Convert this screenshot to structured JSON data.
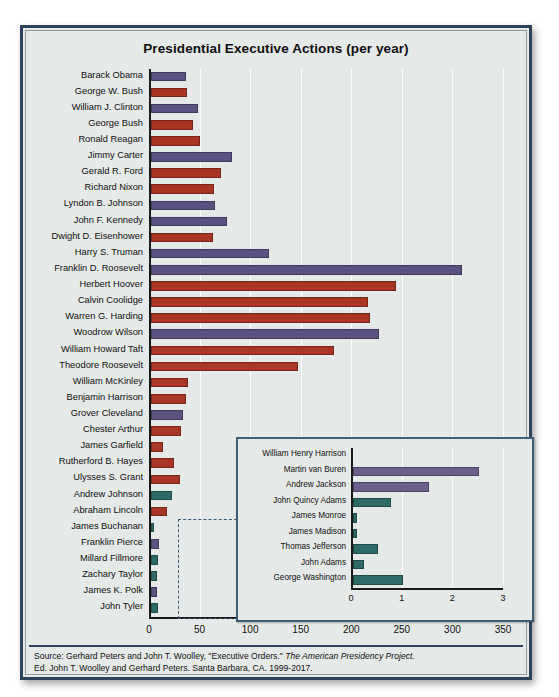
{
  "figure": {
    "title": "Presidential Executive Actions (per year)",
    "source_line1_pre": "Source: Gerhard Peters and John T. Woolley, \"Executive Orders.\" ",
    "source_line1_italic": "The American Presidency Project.",
    "source_line2": "Ed. John T. Woolley and Gerhard Peters. Santa Barbara, CA. 1999-2017."
  },
  "colors": {
    "democrat_purple": "#5c5282",
    "republican_red": "#a93524",
    "early_teal": "#2e6b66",
    "frame": "#2c4258",
    "panel_bg": "#e5e9e7",
    "gridline": "#fbfcfb",
    "axis": "#1a1a1a"
  },
  "chart_data": {
    "type": "bar",
    "title": "Presidential Executive Actions (per year)",
    "xlabel": "",
    "ylabel": "",
    "orientation": "horizontal",
    "xlim": [
      0,
      350
    ],
    "xticks": [
      0,
      50,
      100,
      150,
      200,
      250,
      300,
      350
    ],
    "grid": true,
    "legend": "none",
    "categories": [
      "Barack Obama",
      "George W. Bush",
      "William J. Clinton",
      "George Bush",
      "Ronald Reagan",
      "Jimmy Carter",
      "Gerald R. Ford",
      "Richard Nixon",
      "Lyndon B. Johnson",
      "John F. Kennedy",
      "Dwight D. Eisenhower",
      "Harry S. Truman",
      "Franklin D. Roosevelt",
      "Herbert Hoover",
      "Calvin Coolidge",
      "Warren G. Harding",
      "Woodrow Wilson",
      "William Howard Taft",
      "Theodore Roosevelt",
      "William McKinley",
      "Benjamin Harrison",
      "Grover Cleveland",
      "Chester Arthur",
      "James Garfield",
      "Rutherford B. Hayes",
      "Ulysses S. Grant",
      "Andrew Johnson",
      "Abraham Lincoln",
      "James Buchanan",
      "Franklin Pierce",
      "Millard Fillmore",
      "Zachary Taylor",
      "James K. Polk",
      "John Tyler"
    ],
    "values": [
      35,
      36,
      46,
      42,
      48,
      80,
      69,
      62,
      63,
      75,
      61,
      117,
      307,
      242,
      215,
      217,
      225,
      181,
      145,
      37,
      35,
      32,
      30,
      12,
      23,
      29,
      21,
      16,
      3,
      8,
      7,
      6,
      6,
      7
    ],
    "bar_colors": [
      "#5c5282",
      "#a93524",
      "#5c5282",
      "#a93524",
      "#a93524",
      "#5c5282",
      "#a93524",
      "#a93524",
      "#5c5282",
      "#5c5282",
      "#a93524",
      "#5c5282",
      "#5c5282",
      "#a93524",
      "#a93524",
      "#a93524",
      "#5c5282",
      "#a93524",
      "#a93524",
      "#a93524",
      "#a93524",
      "#5c5282",
      "#a93524",
      "#a93524",
      "#a93524",
      "#a93524",
      "#2e6b66",
      "#a93524",
      "#2e6b66",
      "#5c5282",
      "#2e6b66",
      "#2e6b66",
      "#5c5282",
      "#2e6b66"
    ]
  },
  "inset_chart_data": {
    "type": "bar",
    "orientation": "horizontal",
    "xlim": [
      0,
      3
    ],
    "xticks": [
      0,
      1,
      2,
      3
    ],
    "grid": true,
    "categories": [
      "William Henry Harrison",
      "Martin van Buren",
      "Andrew Jackson",
      "John Quincy Adams",
      "James Monroe",
      "James Madison",
      "Thomas Jefferson",
      "John Adams",
      "George Washington"
    ],
    "values": [
      0,
      2.5,
      1.5,
      0.75,
      0.08,
      0.08,
      0.5,
      0.23,
      1.0
    ],
    "bar_colors": [
      "#5c5282",
      "#6b5f8c",
      "#6b5f8c",
      "#2e6b66",
      "#2e6b66",
      "#2e6b66",
      "#2e6b66",
      "#2e6b66",
      "#2e6b66"
    ]
  }
}
